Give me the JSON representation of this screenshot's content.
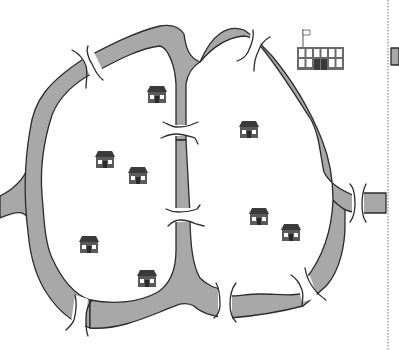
{
  "figure": {
    "type": "map-diagram"
  },
  "colors": {
    "background": "#ffffff",
    "river_fill": "#a8a8a8",
    "outline": "#2b2b2b",
    "house_roof": "#3a3a3a",
    "house_wall": "#5a5a5a",
    "window": "#ffffff",
    "school_frame": "#6a6a6a",
    "divider": "#777777"
  },
  "houses": [
    {
      "x": 146,
      "y": 86
    },
    {
      "x": 94,
      "y": 151
    },
    {
      "x": 127,
      "y": 167
    },
    {
      "x": 238,
      "y": 121
    },
    {
      "x": 78,
      "y": 236
    },
    {
      "x": 136,
      "y": 270
    },
    {
      "x": 248,
      "y": 208
    },
    {
      "x": 280,
      "y": 224
    }
  ],
  "school": {
    "x": 297,
    "y": 29
  },
  "bridges_count": 8
}
